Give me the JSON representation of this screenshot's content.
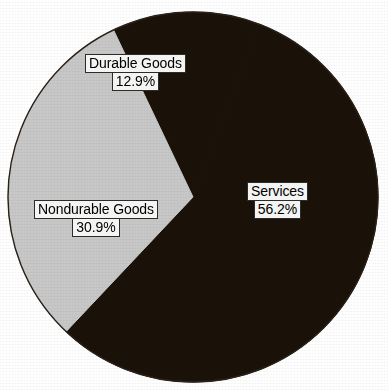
{
  "chart_data": {
    "type": "pie",
    "title": "",
    "subtitle": "",
    "xlabel": "",
    "ylabel": "",
    "legend_position": "none",
    "grid": false,
    "labels_inside": true,
    "value_unit": "percent",
    "categories": [
      "Services",
      "Nondurable Goods",
      "Durable Goods"
    ],
    "values": [
      56.2,
      30.9,
      12.9
    ],
    "slices": [
      {
        "name": "Services",
        "label": "Services",
        "value": 56.2,
        "value_label": "56.2%",
        "color": "#1a1208",
        "start_angle_deg": 21.0,
        "end_angle_deg": 223.3
      },
      {
        "name": "Nondurable Goods",
        "label": "Nondurable Goods",
        "value": 30.9,
        "value_label": "30.9%",
        "color": "#c8c8c8",
        "start_angle_deg": 223.3,
        "end_angle_deg": 334.5
      },
      {
        "name": "Durable Goods",
        "label": "Durable Goods",
        "value": 12.9,
        "value_label": "12.9%",
        "color": "#1a1208",
        "start_angle_deg": 334.5,
        "end_angle_deg": 381.0
      }
    ],
    "geometry": {
      "center_x": 193,
      "center_y": 197,
      "radius": 185
    },
    "colors": {
      "background": "#ffffff",
      "dark_slice": "#1a1208",
      "light_slice": "#c8c8c8",
      "outline": "#1a1208",
      "label_box_fill": "#f4f4f2",
      "label_box_border": "#2b2b2b",
      "label_text": "#000000"
    }
  }
}
